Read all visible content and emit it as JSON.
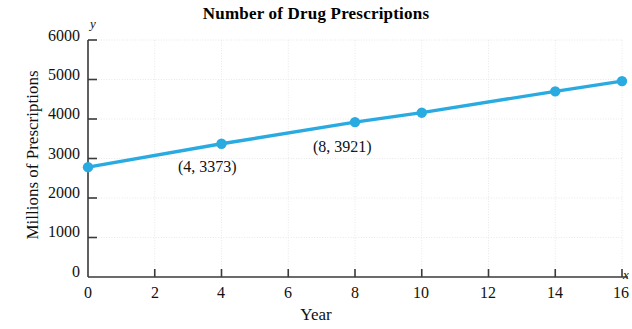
{
  "chart_data": {
    "type": "line",
    "title": "Number of Drug Prescriptions",
    "xlabel": "Year",
    "ylabel": "Millions of  Prescriptions",
    "x_axis_letter": "y",
    "y_axis_letter": "x",
    "x": [
      0,
      4,
      8,
      10,
      14,
      16
    ],
    "values": [
      2780,
      3373,
      3921,
      4160,
      4700,
      4960
    ],
    "series": [
      {
        "name": "Number of Drug Prescriptions",
        "x": [
          0,
          4,
          8,
          10,
          14,
          16
        ],
        "values": [
          2780,
          3373,
          3921,
          4160,
          4700,
          4960
        ]
      }
    ],
    "xlim": [
      0,
      16
    ],
    "ylim": [
      0,
      6000
    ],
    "xticks": [
      0,
      2,
      4,
      6,
      8,
      10,
      12,
      14,
      16
    ],
    "xtick_labels": [
      "0",
      "2",
      "4",
      "6",
      "8",
      "10",
      "12",
      "14",
      "16"
    ],
    "yticks": [
      0,
      1000,
      2000,
      3000,
      4000,
      5000,
      6000
    ],
    "ytick_labels": [
      "0",
      "1000",
      "2000",
      "3000",
      "4000",
      "5000",
      "6000"
    ],
    "grid": true,
    "legend": null,
    "legend_position": "none",
    "line_color": "#29abe2",
    "marker_color": "#29abe2",
    "grid_color": "#e8e8e8",
    "axis_color": "#3a3a3a",
    "annotations": [
      {
        "text": "(4, 3373)",
        "x": 4,
        "y": 3373
      },
      {
        "text": "(8, 3921)",
        "x": 8,
        "y": 3921
      }
    ]
  }
}
